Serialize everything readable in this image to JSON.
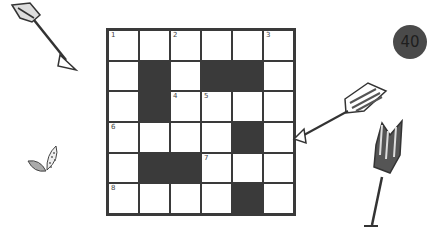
{
  "puzzle": {
    "badge_number": "40",
    "rows": 6,
    "cols": 6,
    "cells": [
      [
        {
          "black": false,
          "num": "1"
        },
        {
          "black": false,
          "num": ""
        },
        {
          "black": false,
          "num": "2"
        },
        {
          "black": false,
          "num": ""
        },
        {
          "black": false,
          "num": ""
        },
        {
          "black": false,
          "num": "3"
        }
      ],
      [
        {
          "black": false,
          "num": ""
        },
        {
          "black": true,
          "num": ""
        },
        {
          "black": false,
          "num": ""
        },
        {
          "black": true,
          "num": ""
        },
        {
          "black": true,
          "num": ""
        },
        {
          "black": false,
          "num": ""
        }
      ],
      [
        {
          "black": false,
          "num": ""
        },
        {
          "black": true,
          "num": ""
        },
        {
          "black": false,
          "num": "4"
        },
        {
          "black": false,
          "num": "5"
        },
        {
          "black": false,
          "num": ""
        },
        {
          "black": false,
          "num": ""
        }
      ],
      [
        {
          "black": false,
          "num": "6"
        },
        {
          "black": false,
          "num": ""
        },
        {
          "black": false,
          "num": ""
        },
        {
          "black": false,
          "num": ""
        },
        {
          "black": true,
          "num": ""
        },
        {
          "black": false,
          "num": ""
        }
      ],
      [
        {
          "black": false,
          "num": ""
        },
        {
          "black": true,
          "num": ""
        },
        {
          "black": true,
          "num": ""
        },
        {
          "black": false,
          "num": "7"
        },
        {
          "black": false,
          "num": ""
        },
        {
          "black": false,
          "num": ""
        }
      ],
      [
        {
          "black": false,
          "num": "8"
        },
        {
          "black": false,
          "num": ""
        },
        {
          "black": false,
          "num": ""
        },
        {
          "black": false,
          "num": ""
        },
        {
          "black": true,
          "num": ""
        },
        {
          "black": false,
          "num": ""
        }
      ]
    ]
  },
  "decorations": [
    "arrow-top-left",
    "arrow-right",
    "arrow-bottom-right",
    "leaves"
  ],
  "colors": {
    "ink": "#3a3a3a",
    "badge": "#4a4a4a",
    "paper": "#ffffff"
  }
}
